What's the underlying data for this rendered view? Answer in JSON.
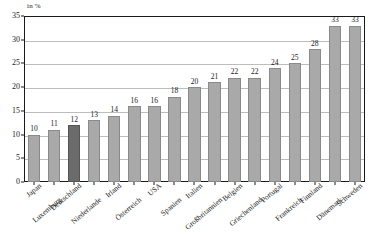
{
  "chart_data": {
    "type": "bar",
    "title": "",
    "subtitle": "",
    "unit_label": "in %",
    "xlabel": "",
    "ylabel": "",
    "ylim": [
      0,
      35
    ],
    "yticks": [
      0,
      5,
      10,
      15,
      20,
      25,
      30,
      35
    ],
    "grid": true,
    "legend": "none",
    "categories": [
      "Japan",
      "Luxemburg",
      "Deutschland",
      "Niederlande",
      "Irland",
      "Österreich",
      "USA",
      "Spanien",
      "Italien",
      "Großbritannien",
      "Belgien",
      "Griechenland",
      "Portugal",
      "Frankreich",
      "Finnland",
      "Dänemark",
      "Schweden"
    ],
    "values": [
      10,
      11,
      12,
      13,
      14,
      16,
      16,
      18,
      20,
      21,
      22,
      22,
      24,
      25,
      28,
      33,
      33
    ],
    "highlight_category": "Deutschland",
    "colors": {
      "bar": "#a9a9a9",
      "bar_highlight": "#6b6b6b",
      "gridline": "#bdbdbd",
      "axis": "#1a1a1a",
      "background": "#ffffff"
    }
  }
}
